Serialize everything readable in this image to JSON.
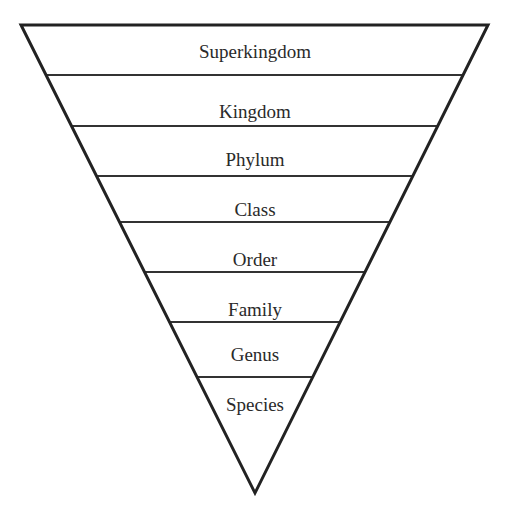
{
  "diagram": {
    "type": "inverted-pyramid",
    "shape": {
      "top_left": [
        21,
        25
      ],
      "top_right": [
        488,
        25
      ],
      "tip": [
        255,
        493
      ],
      "outline_color": "#222222",
      "outline_width": 3,
      "divider_color": "#333333",
      "divider_width": 2,
      "fill": "#ffffff"
    },
    "dividers_y": [
      75,
      126,
      176,
      222,
      272,
      322,
      377
    ],
    "levels": [
      {
        "label": "Superkingdom",
        "baseline_y": 58
      },
      {
        "label": "Kingdom",
        "baseline_y": 118
      },
      {
        "label": "Phylum",
        "baseline_y": 166
      },
      {
        "label": "Class",
        "baseline_y": 216
      },
      {
        "label": "Order",
        "baseline_y": 266
      },
      {
        "label": "Family",
        "baseline_y": 316
      },
      {
        "label": "Genus",
        "baseline_y": 361
      },
      {
        "label": "Species",
        "baseline_y": 411
      }
    ]
  }
}
